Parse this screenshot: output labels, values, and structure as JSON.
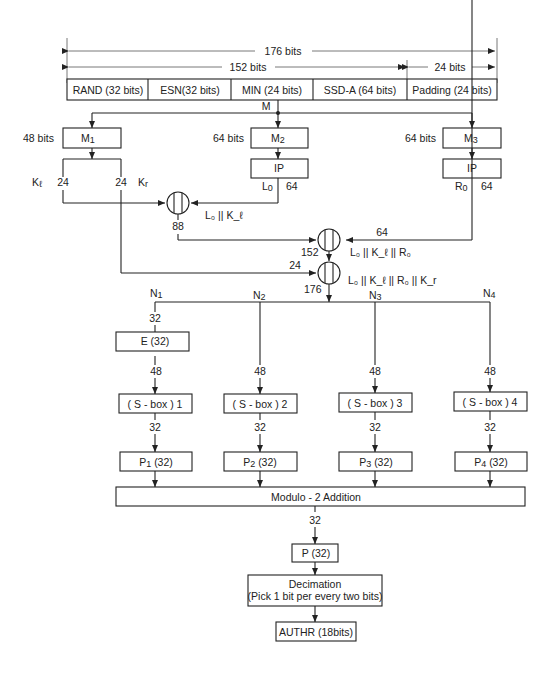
{
  "diagram": {
    "top_bar": {
      "total_bits": "176 bits",
      "left_span": "152 bits",
      "right_span": "24 bits",
      "fields": [
        {
          "label": "RAND (32 bits)"
        },
        {
          "label": "ESN(32 bits)"
        },
        {
          "label": "MIN (24 bits)"
        },
        {
          "label": "SSD-A (64 bits)"
        },
        {
          "label": "Padding (24 bits)"
        }
      ],
      "output_label": "M"
    },
    "branches": {
      "m1": {
        "label": "M",
        "sub": "1",
        "bits": "48 bits"
      },
      "m2": {
        "label": "M",
        "sub": "2",
        "bits": "64 bits"
      },
      "m3": {
        "label": "M",
        "sub": "3",
        "bits": "64 bits"
      },
      "ip2": {
        "label": "IP"
      },
      "ip3": {
        "label": "IP"
      },
      "kl": {
        "label": "K",
        "sub": "ℓ",
        "bits": "24"
      },
      "kr": {
        "label": "K",
        "sub": "r",
        "bits": "24"
      },
      "l0": {
        "label": "L",
        "sub": "0",
        "bits": "64"
      },
      "r0": {
        "label": "R",
        "sub": "0",
        "bits": "64"
      }
    },
    "concat": {
      "c1": {
        "label": "L₀ || K_ℓ",
        "out_bits": "88"
      },
      "c2": {
        "label": "L₀ || K_ℓ || R₀",
        "in_bits": "64",
        "out_bits": "152"
      },
      "c3": {
        "label": "L₀ || K_ℓ || R₀ || K_r",
        "in_bits": "24",
        "out_bits": "176"
      }
    },
    "rounds": [
      {
        "n": "N",
        "sub": "1",
        "in_bits": "32",
        "expand": "E (32)",
        "mid_bits": "48",
        "sbox": "( S - box ) 1",
        "out_bits": "32",
        "perm": "P",
        "perm_sub": "1",
        "perm_size": "(32)"
      },
      {
        "n": "N",
        "sub": "2",
        "mid_bits": "48",
        "sbox": "( S - box ) 2",
        "out_bits": "32",
        "perm": "P",
        "perm_sub": "2",
        "perm_size": "(32)"
      },
      {
        "n": "N",
        "sub": "3",
        "mid_bits": "48",
        "sbox": "( S - box ) 3",
        "out_bits": "32",
        "perm": "P",
        "perm_sub": "3",
        "perm_size": "(32)"
      },
      {
        "n": "N",
        "sub": "4",
        "mid_bits": "48",
        "sbox": "( S - box ) 4",
        "out_bits": "32",
        "perm": "P",
        "perm_sub": "4",
        "perm_size": "(32)"
      }
    ],
    "modulo": {
      "label": "Modulo - 2 Addition",
      "out_bits": "32"
    },
    "final_perm": {
      "label": "P (32)"
    },
    "decimation": {
      "line1": "Decimation",
      "line2": "(Pick 1 bit per every two bits)"
    },
    "output": {
      "label": "AUTHR (18bits)"
    }
  }
}
